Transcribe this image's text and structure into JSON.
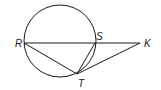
{
  "diagram": {
    "type": "geometry",
    "circle": {
      "cx": 60,
      "cy": 41,
      "r": 36
    },
    "points": {
      "R": {
        "x": 24,
        "y": 43,
        "label": "R",
        "lx": 15,
        "ly": 47
      },
      "S": {
        "x": 95,
        "y": 43,
        "label": "S",
        "lx": 96,
        "ly": 40
      },
      "K": {
        "x": 140,
        "y": 43,
        "label": "K",
        "lx": 144,
        "ly": 47
      },
      "T": {
        "x": 77,
        "y": 74,
        "label": "T",
        "lx": 78,
        "ly": 87
      }
    },
    "segments": [
      {
        "from": "R",
        "to": "K",
        "name": "secant-RK"
      },
      {
        "from": "R",
        "to": "T",
        "name": "chord-RT"
      },
      {
        "from": "S",
        "to": "T",
        "name": "chord-ST"
      },
      {
        "from": "T",
        "to": "K",
        "name": "tangent-TK"
      }
    ],
    "stroke_color": "#1a1a1a",
    "background": "#ffffff"
  }
}
